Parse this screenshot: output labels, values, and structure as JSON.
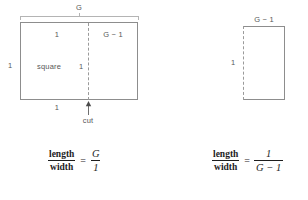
{
  "figure": {
    "title_text": "",
    "colors": {
      "stroke": "#8d8d8d",
      "dashed_stroke": "#9a9a9a",
      "extent_stroke": "#b4b4b4",
      "label_text": "#585858",
      "formula_text": "#1d1d1d",
      "background": "#ffffff"
    }
  },
  "left_figure": {
    "extent_label": "G",
    "square_label": "square",
    "top_left_label": "1",
    "top_right_label": "G − 1",
    "left_label": "1",
    "inner_right_label": "1",
    "bottom_label": "1",
    "cut_label": "cut"
  },
  "right_figure": {
    "top_label": "G − 1",
    "left_label": "1"
  },
  "left_formula": {
    "numerator": "length",
    "denominator": "width",
    "equals": "=",
    "rhs_numerator": "G",
    "rhs_denominator": "1"
  },
  "right_formula": {
    "numerator": "length",
    "denominator": "width",
    "equals": "=",
    "rhs_numerator": "1",
    "rhs_denominator": "G − 1"
  }
}
